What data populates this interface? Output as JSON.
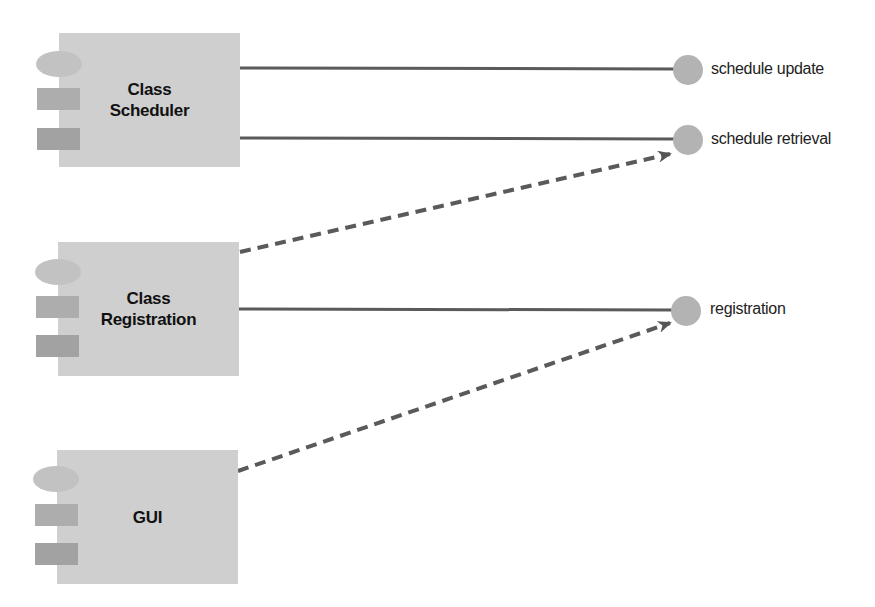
{
  "diagram": {
    "type": "UML component diagram",
    "colors": {
      "component_fill": "#cfcfcf",
      "ellipse_fill": "#c2c2c2",
      "tab_fill_1": "#adadad",
      "tab_fill_2": "#a2a2a2",
      "interface_fill": "#b3b3b3",
      "line_color": "#5a5a5a"
    },
    "components": [
      {
        "id": "class-scheduler",
        "line1": "Class",
        "line2": "Scheduler"
      },
      {
        "id": "class-registration",
        "line1": "Class",
        "line2": "Registration"
      },
      {
        "id": "gui",
        "line1": "GUI",
        "line2": ""
      }
    ],
    "interfaces": [
      {
        "id": "schedule-update",
        "label": "schedule update"
      },
      {
        "id": "schedule-retrieval",
        "label": "schedule retrieval"
      },
      {
        "id": "registration",
        "label": "registration"
      }
    ],
    "connections": [
      {
        "from": "Class Scheduler",
        "to": "schedule update",
        "style": "solid",
        "kind": "realization"
      },
      {
        "from": "Class Scheduler",
        "to": "schedule retrieval",
        "style": "solid",
        "kind": "realization"
      },
      {
        "from": "Class Registration",
        "to": "schedule retrieval",
        "style": "dashed",
        "kind": "dependency"
      },
      {
        "from": "Class Registration",
        "to": "registration",
        "style": "solid",
        "kind": "realization"
      },
      {
        "from": "GUI",
        "to": "registration",
        "style": "dashed",
        "kind": "dependency"
      }
    ]
  }
}
